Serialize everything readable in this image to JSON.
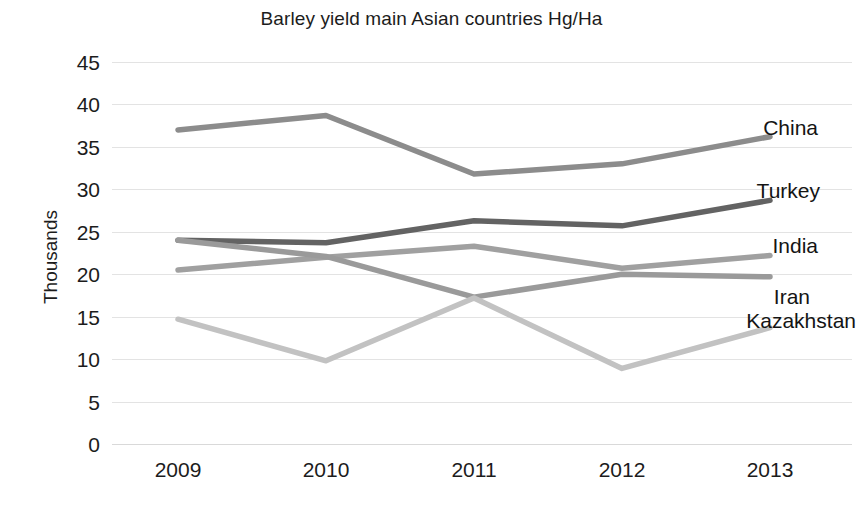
{
  "chart_data": {
    "type": "line",
    "title": "Barley yield main Asian countries Hg/Ha",
    "xlabel": "",
    "ylabel": "Thousands",
    "categories": [
      "2009",
      "2010",
      "2011",
      "2012",
      "2013"
    ],
    "ylim": [
      0,
      45
    ],
    "yticks": [
      45,
      40,
      35,
      30,
      25,
      20,
      15,
      10,
      5,
      0
    ],
    "grid": true,
    "legend_position": "right-inline-labels",
    "series": [
      {
        "name": "China",
        "values": [
          37.0,
          38.7,
          31.8,
          33.0,
          36.2
        ],
        "color": "#8c8c8c"
      },
      {
        "name": "Turkey",
        "values": [
          24.0,
          23.7,
          26.3,
          25.7,
          28.7
        ],
        "color": "#636363"
      },
      {
        "name": "India",
        "values": [
          20.5,
          22.0,
          23.3,
          20.7,
          22.2
        ],
        "color": "#a0a0a0"
      },
      {
        "name": "Iran",
        "values": [
          24.0,
          22.1,
          17.3,
          20.0,
          19.7
        ],
        "color": "#9a9a9a"
      },
      {
        "name": "Kazakhstan",
        "values": [
          14.7,
          9.8,
          17.2,
          8.9,
          13.7
        ],
        "color": "#c2c2c2"
      }
    ]
  },
  "labels": {
    "china": "China",
    "turkey": "Turkey",
    "india": "India",
    "iran": "Iran",
    "kazakhstan": "Kazakhstan"
  }
}
